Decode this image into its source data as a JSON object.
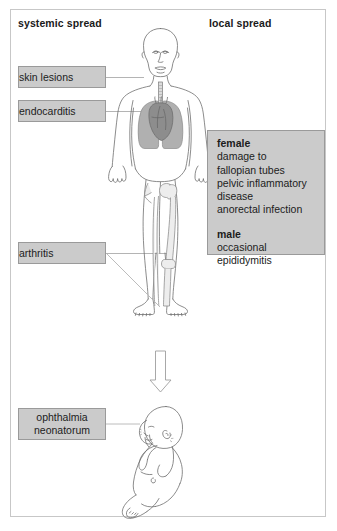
{
  "figure": {
    "headings": {
      "systemic": "systemic spread",
      "local": "local spread"
    },
    "systemic_labels": [
      {
        "id": "skin",
        "text": "skin lesions"
      },
      {
        "id": "endo",
        "text": "endocarditis"
      },
      {
        "id": "arthritis",
        "text": "arthritis"
      }
    ],
    "neonatal_label": {
      "line1": "ophthalmia",
      "line2": "neonatorum"
    },
    "local_panel": {
      "female": {
        "title": "female",
        "lines": [
          "damage to",
          "fallopian tubes",
          "pelvic inflammatory",
          "disease",
          "anorectal infection"
        ]
      },
      "male": {
        "title": "male",
        "lines": [
          "occasional",
          "epididymitis"
        ]
      }
    },
    "figures": {
      "adult": "adult-human-body-anatomical-outline",
      "infant": "newborn-infant-outline",
      "arrow": "downward-transmission-arrow"
    },
    "colors": {
      "label_box_fill": "#cbcbcb",
      "label_box_border": "#9a9a9a",
      "frame_border": "#c7c7c7",
      "body_outline": "#6e6e6e",
      "lung_fill": "#b0b0b0",
      "heart_fill": "#8d8d8d",
      "bone_fill": "#ededed",
      "connector": "#b4b4b4",
      "text": "#1c1c1c",
      "background": "#ffffff"
    }
  }
}
